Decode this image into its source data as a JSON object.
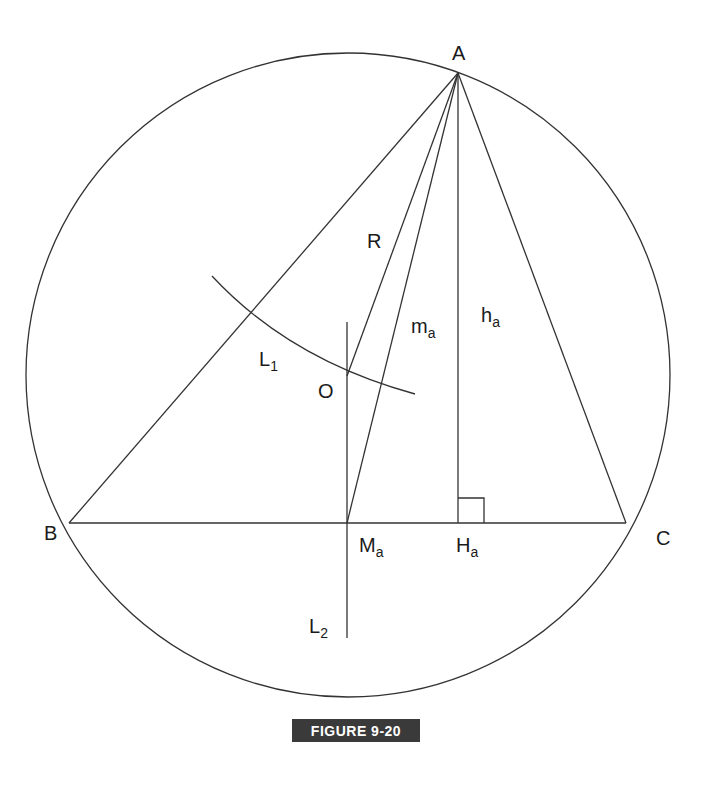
{
  "figure": {
    "caption": "FIGURE 9-20",
    "caption_color": "#3a3a3a",
    "line_color": "#333333"
  },
  "points": {
    "A": {
      "label": "A",
      "x": 458,
      "y": 73
    },
    "B": {
      "label": "B",
      "x": 69,
      "y": 523
    },
    "C": {
      "label": "C",
      "x": 626,
      "y": 523
    },
    "O": {
      "label": "O",
      "x": 347,
      "y": 376
    },
    "Ma": {
      "label": "M",
      "sub": "a",
      "x": 347,
      "y": 523
    },
    "Ha": {
      "label": "H",
      "sub": "a",
      "x": 458,
      "y": 523
    }
  },
  "segment_labels": {
    "R": {
      "label": "R"
    },
    "ma": {
      "label": "m",
      "sub": "a"
    },
    "ha": {
      "label": "h",
      "sub": "a"
    },
    "L1": {
      "label": "L",
      "sub": "1"
    },
    "L2": {
      "label": "L",
      "sub": "2"
    }
  },
  "circle": {
    "cx": 348,
    "cy": 375,
    "r": 322
  }
}
